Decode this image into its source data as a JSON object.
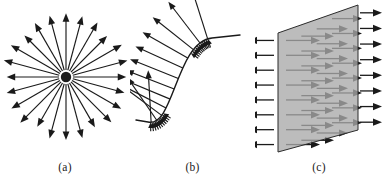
{
  "figure": {
    "width": 383,
    "height": 177,
    "background": "#ffffff",
    "ink_color": "#1a1a1a",
    "panels": [
      {
        "id": "a",
        "caption": "(a)",
        "kind": "radial-point-source-vector-field",
        "center": {
          "x": 66,
          "y": 77
        },
        "dot_radius": 5.2,
        "ray_count": 24,
        "ray_inner_radius": 7,
        "ray_outer_radius": 62,
        "ray_outer_radius_y": 62,
        "start_angle_deg": -90,
        "stroke_width": 1.15,
        "arrow_head_len": 8.5,
        "arrow_head_half_width": 3.4
      },
      {
        "id": "b",
        "caption": "(b)",
        "kind": "normal-vectors-on-s-curve",
        "curve": {
          "start": {
            "x": 18,
            "y": 122
          },
          "c1": {
            "x": 44,
            "y": 128
          },
          "c2": {
            "x": 46,
            "y": 42
          },
          "end": {
            "x": 82,
            "y": 38
          },
          "end_tail": {
            "x": 110,
            "y": 35
          },
          "start_tail": {
            "x": 6,
            "y": 120
          }
        },
        "long_arrow_count": 12,
        "long_arrow_len": 52,
        "short_arrow_count": 22,
        "short_arrow_len": 9,
        "stroke_width": 1.15,
        "curve_stroke_width": 1.4,
        "arrow_head_len": 8,
        "arrow_head_half_width": 3.2
      },
      {
        "id": "c",
        "caption": "(c)",
        "kind": "uniform-field-through-plane",
        "plane": {
          "fill": "#a9a9a9",
          "stroke": "#2b2b2b",
          "stroke_width": 1.0,
          "top_left": {
            "x": 23,
            "y": 33
          },
          "top_right": {
            "x": 103,
            "y": 5
          },
          "bottom_right": {
            "x": 103,
            "y": 130
          },
          "bottom_left": {
            "x": 23,
            "y": 152
          }
        },
        "row_count": 8,
        "depth_columns": 4,
        "outside_arrow_len": 26,
        "inside_arrow_len": 34,
        "stroke_width": 1.3,
        "arrow_head_len": 9,
        "arrow_head_half_width": 3.6
      }
    ]
  }
}
